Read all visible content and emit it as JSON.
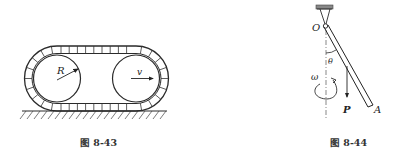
{
  "figures": [
    {
      "id": "fig-8-43",
      "caption": "图 8-43",
      "labels": {
        "radius": "R",
        "velocity": "v"
      },
      "description": "Tracked vehicle: two wheels of radius R inside a segmented track on ground, moving with velocity v"
    },
    {
      "id": "fig-8-44",
      "caption": "图 8-44",
      "labels": {
        "pivot": "O",
        "end": "A",
        "angle": "θ",
        "angular_velocity": "ω",
        "weight": "P"
      },
      "description": "Rod OA hinged at O, inclined at angle θ to vertical axis, rotating with angular velocity ω, weight P"
    }
  ]
}
